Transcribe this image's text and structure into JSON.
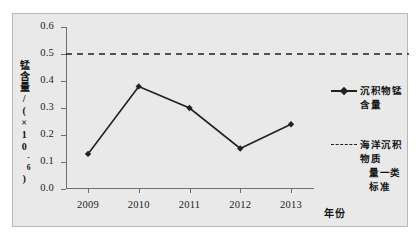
{
  "chart_data": {
    "type": "line",
    "title": "",
    "xlabel": "年份",
    "ylabel": "锰含量/(×10⁻⁶)",
    "ylabel_main": "锰含量/(×10",
    "ylabel_exp": "-6",
    "ylabel_tail": ")",
    "categories": [
      "2009",
      "2010",
      "2011",
      "2012",
      "2013"
    ],
    "xtick_labels": [
      "2009",
      "2010",
      "2011",
      "2012",
      "2013"
    ],
    "ytick_labels": [
      "0.0",
      "0.1",
      "0.2",
      "0.3",
      "0.4",
      "0.5",
      "0.6"
    ],
    "ytick_values": [
      0.0,
      0.1,
      0.2,
      0.3,
      0.4,
      0.5,
      0.6
    ],
    "ylim": [
      0.0,
      0.6
    ],
    "grid": false,
    "legend_position": "right",
    "series": [
      {
        "name": "沉积物锰含量",
        "style": "solid-diamond",
        "color": "#222222",
        "values": [
          0.13,
          0.38,
          0.3,
          0.15,
          0.24
        ]
      },
      {
        "name": "海洋沉积物质量一类标准",
        "name_line1": "海洋沉积物质",
        "name_line2": "量一类标准",
        "style": "dashed",
        "color": "#222222",
        "constant_value": 0.5
      }
    ]
  },
  "legend": {
    "entries": [
      {
        "label": "沉积物锰含量",
        "marker": "solid-diamond-line"
      },
      {
        "label_line1": "海洋沉积物质",
        "label_line2": "量一类标准",
        "marker": "dashed-line"
      }
    ]
  },
  "axes": {
    "x_title": "年份",
    "y_title_main": "锰含量/(×10",
    "y_title_exp": "-6",
    "y_title_close": ")"
  },
  "colors": {
    "figure_background": "#e9e9e9",
    "page_background": "#ffffff",
    "frame_border": "#b9b9b9",
    "axis": "#6e6e6e",
    "series_line": "#222222",
    "text": "#141414"
  }
}
